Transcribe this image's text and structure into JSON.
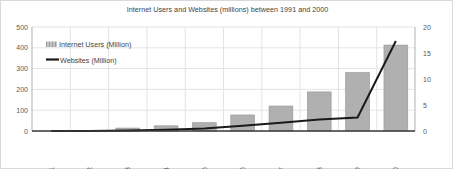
{
  "chart_data": {
    "type": "bar",
    "title": "Internet Users and Websites (millions) between 1991 and 2000",
    "xlabel": "",
    "ylabel": "",
    "grid": true,
    "legend_position": "top-left",
    "categories": [
      "1991",
      "1992",
      "1993",
      "1994",
      "1995",
      "1996",
      "1997",
      "1998",
      "1999",
      "2000"
    ],
    "ylim": [
      0,
      500
    ],
    "y2lim": [
      0,
      20
    ],
    "yticks": [
      "0",
      "100",
      "200",
      "300",
      "400",
      "500"
    ],
    "y2ticks": [
      "0",
      "5",
      "10",
      "15",
      "20"
    ],
    "series": [
      {
        "name": "Internet Users (Million)",
        "type": "bar",
        "axis": "left",
        "color": "#b0b0b0",
        "values": [
          0,
          0,
          14,
          25,
          40,
          77,
          120,
          188,
          281,
          413
        ]
      },
      {
        "name": "Websites (Million)",
        "type": "line",
        "axis": "right",
        "color": "#1a1a1a",
        "values": [
          0.0,
          0.01,
          0.1,
          0.25,
          0.5,
          1.0,
          1.6,
          2.2,
          2.6,
          17.3
        ]
      }
    ]
  },
  "legend": {
    "items": [
      {
        "label": "Internet Users (Million)",
        "marker": "bar-swatch"
      },
      {
        "label": "Websites (Million)",
        "marker": "line-swatch"
      }
    ]
  },
  "colors": {
    "bar_fill": "#b0b0b0",
    "bar_stroke": "#9a9a9a",
    "line": "#1a1a1a",
    "grid": "#e4e4e4",
    "axis": "#bfbfbf",
    "text": "#595959",
    "title_text": "#3f3f3f"
  }
}
